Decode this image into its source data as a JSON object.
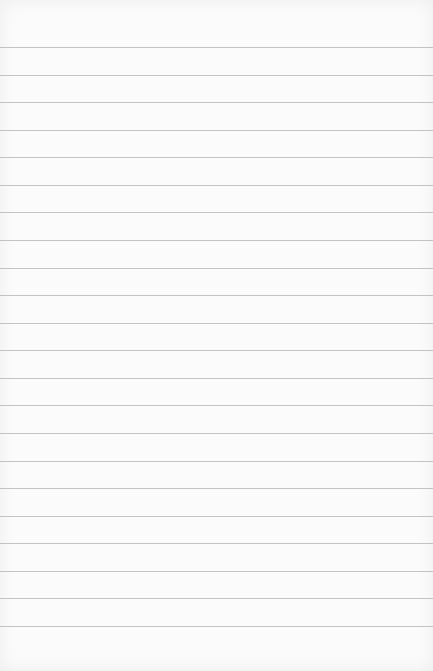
{
  "paper": {
    "background": "#fbfbfb",
    "line_color": "#b8b8b8",
    "first_line_y": 47,
    "line_spacing": 27.57,
    "line_count": 22
  }
}
